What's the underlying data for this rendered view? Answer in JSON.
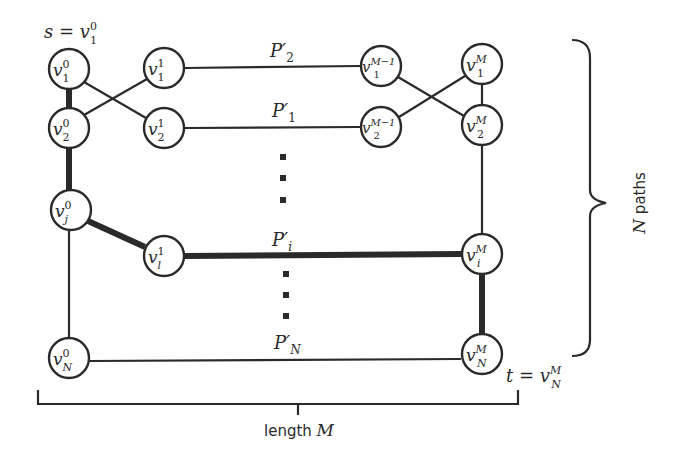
{
  "diagram": {
    "type": "graph",
    "colors": {
      "stroke": "#2a2a2a",
      "background": "#ffffff",
      "node_fill": "#ffffff"
    },
    "source_label": {
      "lhs": "s = ",
      "base": "v",
      "sup": "0",
      "sub": "1"
    },
    "target_label": {
      "lhs": "t = ",
      "base": "v",
      "sup": "M",
      "sub": "N"
    },
    "nodes": [
      {
        "id": "v1_0",
        "base": "v",
        "sup": "0",
        "sub": "1"
      },
      {
        "id": "v2_0",
        "base": "v",
        "sup": "0",
        "sub": "2"
      },
      {
        "id": "vj_0",
        "base": "v",
        "sup": "0",
        "sub": "j"
      },
      {
        "id": "vN_0",
        "base": "v",
        "sup": "0",
        "sub": "N"
      },
      {
        "id": "v1_1",
        "base": "v",
        "sup": "1",
        "sub": "1"
      },
      {
        "id": "v2_1",
        "base": "v",
        "sup": "1",
        "sub": "2"
      },
      {
        "id": "vl_1",
        "base": "v",
        "sup": "1",
        "sub": "l"
      },
      {
        "id": "v1_M-1",
        "base": "v",
        "sup": "M−1",
        "sub": "1"
      },
      {
        "id": "v2_M-1",
        "base": "v",
        "sup": "M−1",
        "sub": "2"
      },
      {
        "id": "v1_M",
        "base": "v",
        "sup": "M",
        "sub": "1"
      },
      {
        "id": "v2_M",
        "base": "v",
        "sup": "M",
        "sub": "2"
      },
      {
        "id": "vi_M",
        "base": "v",
        "sup": "M",
        "sub": "i"
      },
      {
        "id": "vN_M",
        "base": "v",
        "sup": "M",
        "sub": "N"
      }
    ],
    "path_labels": [
      {
        "id": "P2",
        "base": "P′",
        "sub": "2"
      },
      {
        "id": "P1",
        "base": "P′",
        "sub": "1"
      },
      {
        "id": "Pi",
        "base": "P′",
        "sub": "i"
      },
      {
        "id": "PN",
        "base": "P′",
        "sub": "N"
      }
    ],
    "bracket_label": {
      "text": "length ",
      "var": "M"
    },
    "brace_label": {
      "var": "N",
      "text": " paths"
    },
    "edges": [
      {
        "from": "v1_0",
        "to": "v2_0",
        "bold": true
      },
      {
        "from": "v2_0",
        "to": "vj_0",
        "bold": true
      },
      {
        "from": "vj_0",
        "to": "vl_1",
        "bold": true
      },
      {
        "from": "vl_1",
        "to": "vi_M",
        "bold": true,
        "label": "P′i"
      },
      {
        "from": "vi_M",
        "to": "vN_M",
        "bold": true
      },
      {
        "from": "v1_0",
        "to": "v2_1",
        "bold": false
      },
      {
        "from": "v2_0",
        "to": "v1_1",
        "bold": false
      },
      {
        "from": "vj_0",
        "to": "vN_0",
        "bold": false
      },
      {
        "from": "v1_1",
        "to": "v1_M-1",
        "bold": false,
        "label": "P′2"
      },
      {
        "from": "v2_1",
        "to": "v2_M-1",
        "bold": false,
        "label": "P′1"
      },
      {
        "from": "v1_M-1",
        "to": "v2_M",
        "bold": false
      },
      {
        "from": "v2_M-1",
        "to": "v1_M",
        "bold": false
      },
      {
        "from": "v1_M",
        "to": "v2_M",
        "bold": false
      },
      {
        "from": "v2_M",
        "to": "vi_M",
        "bold": false
      },
      {
        "from": "vN_0",
        "to": "vN_M",
        "bold": false,
        "label": "P′N"
      }
    ]
  }
}
